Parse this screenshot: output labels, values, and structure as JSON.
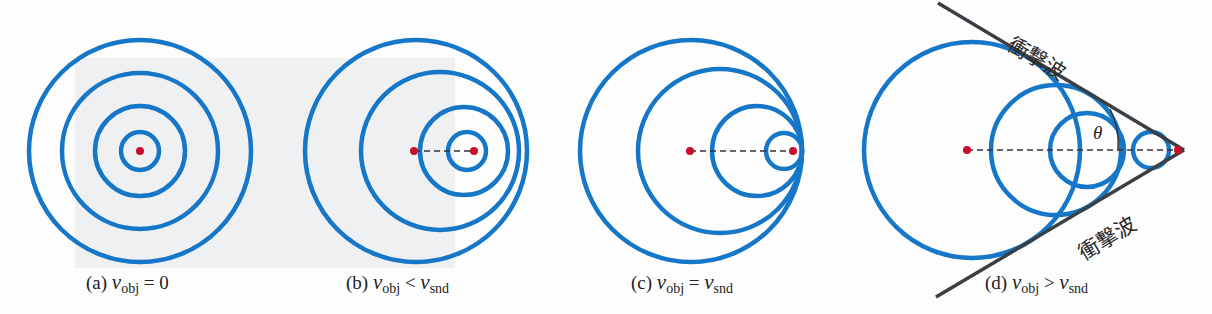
{
  "colors": {
    "wave": "#1677c8",
    "source": "#c8102e",
    "shock": "#3a3f44",
    "dash": "#333333",
    "shade": "#eceff1"
  },
  "panels": [
    {
      "id": "a",
      "label": "(a)",
      "var": "v",
      "sub1": "obj",
      "op": "=",
      "rhs": "0",
      "rhs_sub": ""
    },
    {
      "id": "b",
      "label": "(b)",
      "var": "v",
      "sub1": "obj",
      "op": "<",
      "rhs": "v",
      "rhs_sub": "snd"
    },
    {
      "id": "c",
      "label": "(c)",
      "var": "v",
      "sub1": "obj",
      "op": "=",
      "rhs": "v",
      "rhs_sub": "snd"
    },
    {
      "id": "d",
      "label": "(d)",
      "var": "v",
      "sub1": "obj",
      "op": ">",
      "rhs": "v",
      "rhs_sub": "snd"
    }
  ],
  "shock_wave_label": "衝撃波",
  "angle_label": "θ"
}
